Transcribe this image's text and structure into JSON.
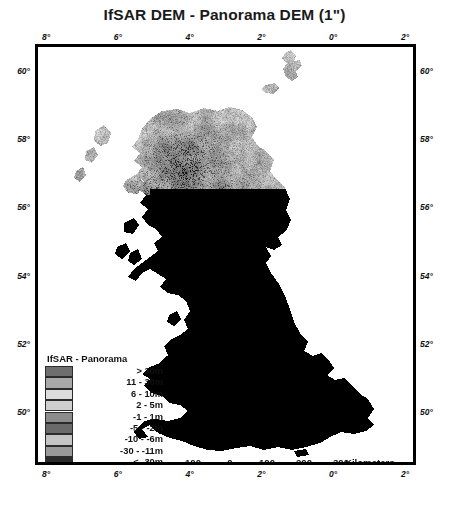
{
  "title": "IfSAR DEM - Panorama DEM (1\")",
  "map": {
    "region_name": "Great Britain",
    "background_color": "#ffffff",
    "frame_color": "#000000"
  },
  "axes": {
    "top_labels": [
      "8°",
      "6°",
      "4°",
      "2°",
      "0°",
      "2°"
    ],
    "bottom_labels": [
      "8°",
      "6°",
      "4°",
      "2°",
      "0°",
      "2°"
    ],
    "left_labels": [
      "60°",
      "58°",
      "56°",
      "54°",
      "52°",
      "50°"
    ],
    "right_labels": [
      "60°",
      "58°",
      "56°",
      "54°",
      "52°",
      "50°"
    ]
  },
  "legend": {
    "title": "IfSAR - Panorama",
    "entries": [
      {
        "label": "> 30m",
        "color": "#6e6e6e"
      },
      {
        "label": "11 - 30m",
        "color": "#a8a8a8"
      },
      {
        "label": "6 - 10m",
        "color": "#dcdcdc"
      },
      {
        "label": "2 - 5m",
        "color": "#cfcfcf"
      },
      {
        "label": "-1 - 1m",
        "color": "#8c8c8c"
      },
      {
        "label": "-5 - -2m",
        "color": "#6a6a6a"
      },
      {
        "label": "-10 - -6m",
        "color": "#c4c4c4"
      },
      {
        "label": "-30 - -11m",
        "color": "#9a9a9a"
      },
      {
        "label": "< -30m",
        "color": "#2b2b2b"
      }
    ]
  },
  "scalebar": {
    "numbers": [
      "100",
      "0",
      "100",
      "200",
      "300"
    ],
    "unit": "Kilometers",
    "segments": [
      "fill",
      "empty",
      "fill",
      "empty",
      "fill"
    ]
  },
  "compass": {
    "label": "N",
    "icon": "north-arrow-star-icon"
  },
  "chart_data": {
    "type": "map",
    "title": "IfSAR DEM - Panorama DEM (1\")",
    "xlabel": "Longitude",
    "ylabel": "Latitude",
    "xlim": [
      -8,
      2
    ],
    "ylim": [
      49.5,
      61
    ],
    "xticks": [
      -8,
      -6,
      -4,
      -2,
      0,
      2
    ],
    "xticklabels": [
      "8°",
      "6°",
      "4°",
      "2°",
      "0°",
      "2°"
    ],
    "yticks": [
      50,
      52,
      54,
      56,
      58,
      60
    ],
    "yticklabels": [
      "50°",
      "52°",
      "54°",
      "56°",
      "58°",
      "60°"
    ],
    "grid": false,
    "legend_position": "lower-left",
    "classes": [
      {
        "label": "> 30m",
        "min": 30,
        "max": null,
        "color": "#6e6e6e"
      },
      {
        "label": "11 - 30m",
        "min": 11,
        "max": 30,
        "color": "#a8a8a8"
      },
      {
        "label": "6 - 10m",
        "min": 6,
        "max": 10,
        "color": "#dcdcdc"
      },
      {
        "label": "2 - 5m",
        "min": 2,
        "max": 5,
        "color": "#cfcfcf"
      },
      {
        "label": "-1 - 1m",
        "min": -1,
        "max": 1,
        "color": "#8c8c8c"
      },
      {
        "label": "-5 - -2m",
        "min": -5,
        "max": -2,
        "color": "#6a6a6a"
      },
      {
        "label": "-10 - -6m",
        "min": -10,
        "max": -6,
        "color": "#c4c4c4"
      },
      {
        "label": "-30 - -11m",
        "min": -30,
        "max": -11,
        "color": "#9a9a9a"
      },
      {
        "label": "< -30m",
        "min": null,
        "max": -30,
        "color": "#2b2b2b"
      }
    ],
    "scalebar_km": [
      100,
      0,
      100,
      200,
      300
    ],
    "scalebar_unit": "Kilometers"
  }
}
